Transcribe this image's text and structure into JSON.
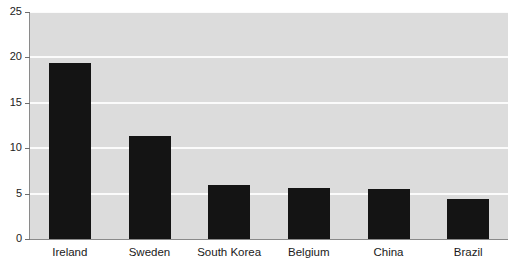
{
  "chart_data": {
    "type": "bar",
    "title": "",
    "xlabel": "",
    "ylabel": "",
    "categories": [
      "Ireland",
      "Sweden",
      "South Korea",
      "Belgium",
      "China",
      "Brazil"
    ],
    "values": [
      19.4,
      11.3,
      5.9,
      5.6,
      5.5,
      4.4
    ],
    "ylim": [
      0,
      25
    ],
    "yticks": [
      0,
      5,
      10,
      15,
      20,
      25
    ],
    "ytick_labels": [
      "0",
      "5",
      "10",
      "15",
      "20",
      "25"
    ],
    "grid": true,
    "grid_axis": "y",
    "legend": false,
    "legend_position": "none",
    "bar_color": "#141414",
    "plot_background": "#dcdcdc",
    "gridline_color": "#fbfbfb",
    "figure_background": "#ffffff"
  }
}
